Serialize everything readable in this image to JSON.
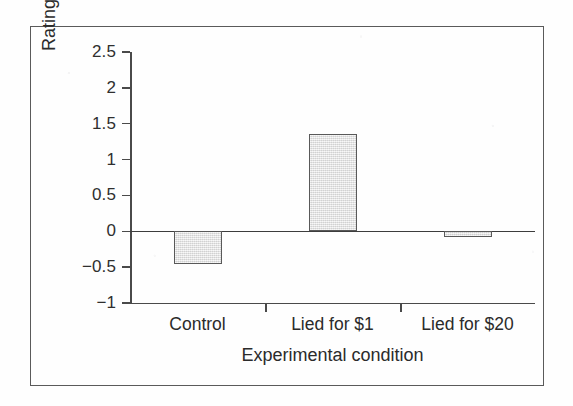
{
  "figure": {
    "frame_color": "#5a5a5a",
    "background_color": "#ffffff"
  },
  "chart_data": {
    "type": "bar",
    "title": "",
    "xlabel": "Experimental condition",
    "ylabel": "Rating of task enjoyment",
    "categories": [
      "Control",
      "Lied for $1",
      "Lied for $20"
    ],
    "values": [
      -0.45,
      1.35,
      -0.08
    ],
    "ylim": [
      -1,
      2.5
    ],
    "ytick_labels": [
      "2.5",
      "2",
      "1.5",
      "1",
      "0.5",
      "0",
      "−0.5",
      "−1"
    ],
    "ytick_values": [
      2.5,
      2,
      1.5,
      1,
      0.5,
      0,
      -0.5,
      -1
    ],
    "grid": false,
    "legend": null,
    "zero_line": true,
    "bar_fill_color": "#dedede",
    "bar_edge_color": "#595959",
    "axis_color": "#4a4a4a"
  },
  "axis": {
    "y_title": "Rating of task enjoyment",
    "x_title": "Experimental condition",
    "ticks": [
      {
        "label": "2.5",
        "value": 2.5
      },
      {
        "label": "2",
        "value": 2
      },
      {
        "label": "1.5",
        "value": 1.5
      },
      {
        "label": "1",
        "value": 1
      },
      {
        "label": "0.5",
        "value": 0.5
      },
      {
        "label": "0",
        "value": 0
      },
      {
        "label": "−0.5",
        "value": -0.5
      },
      {
        "label": "−1",
        "value": -1
      }
    ]
  },
  "bars": [
    {
      "label": "Control",
      "value": -0.45
    },
    {
      "label": "Lied for $1",
      "value": 1.35
    },
    {
      "label": "Lied for $20",
      "value": -0.08
    }
  ]
}
